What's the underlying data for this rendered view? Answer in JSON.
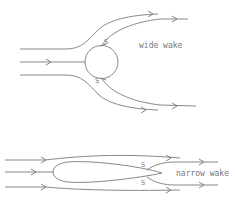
{
  "diagram": {
    "top": {
      "body": "circle",
      "label": "wide wake",
      "separation_mark": "S"
    },
    "bottom": {
      "body": "streamlined",
      "label": "narrow wake",
      "separation_mark": "S"
    }
  }
}
